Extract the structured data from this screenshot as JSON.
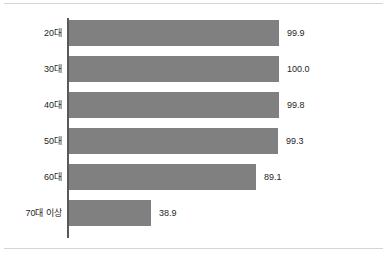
{
  "chart_data": {
    "type": "bar",
    "orientation": "horizontal",
    "title": "",
    "subtitle": "",
    "xlabel": "",
    "ylabel": "",
    "xlim": [
      0,
      100
    ],
    "grid": false,
    "legend": null,
    "bar_color": "#808080",
    "axis_color": "#595959",
    "text_color": "#262626",
    "categories": [
      "20대",
      "30대",
      "40대",
      "50대",
      "60대",
      "70대 이상"
    ],
    "values": [
      99.9,
      100.0,
      99.8,
      99.3,
      89.1,
      38.9
    ],
    "value_labels": [
      "99.9",
      "100.0",
      "99.8",
      "99.3",
      "89.1",
      "38.9"
    ],
    "points": [
      {
        "category": "20대",
        "value": 99.9,
        "label": "99.9"
      },
      {
        "category": "30대",
        "value": 100.0,
        "label": "100.0"
      },
      {
        "category": "40대",
        "value": 99.8,
        "label": "99.8"
      },
      {
        "category": "50대",
        "value": 99.3,
        "label": "99.3"
      },
      {
        "category": "60대",
        "value": 89.1,
        "label": "89.1"
      },
      {
        "category": "70대 이상",
        "value": 38.9,
        "label": "38.9"
      }
    ]
  }
}
